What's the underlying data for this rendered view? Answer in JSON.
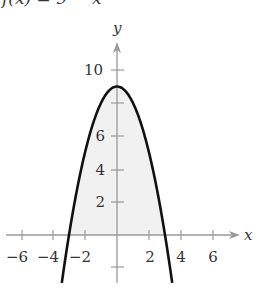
{
  "title": "f(x) = 9 − x²",
  "colors": {
    "curve": "#111111",
    "axis": "#9a9a9a",
    "fill": "#f1f1f1",
    "label": "#333333"
  },
  "chart_data": {
    "type": "line",
    "title": "f(x) = 9 − x²",
    "function": "9 - x^2",
    "xlabel": "x",
    "ylabel": "y",
    "xlim": [
      -7,
      7.5
    ],
    "ylim": [
      -3,
      12
    ],
    "x_ticks": [
      -6,
      -4,
      -2,
      2,
      4,
      6
    ],
    "x_tick_labels": [
      "−6",
      "−4",
      "−2",
      "2",
      "4",
      "6"
    ],
    "y_ticks": [
      -2,
      2,
      4,
      6,
      8,
      10
    ],
    "y_tick_labels": [
      "2",
      "4",
      "6",
      "10"
    ],
    "grid": false,
    "shaded_region": "area between curve and x-axis for -3 ≤ x ≤ 3",
    "series": [
      {
        "name": "f(x)",
        "x": [
          -3.45,
          -3,
          -2.5,
          -2,
          -1.5,
          -1,
          -0.5,
          0,
          0.5,
          1,
          1.5,
          2,
          2.5,
          3,
          3.45
        ],
        "values": [
          -2.9,
          0,
          2.75,
          5,
          6.75,
          8,
          8.75,
          9,
          8.75,
          8,
          6.75,
          5,
          2.75,
          0,
          -2.9
        ]
      }
    ],
    "key_points": {
      "vertex": [
        0,
        9
      ],
      "roots": [
        -3,
        3
      ]
    }
  }
}
